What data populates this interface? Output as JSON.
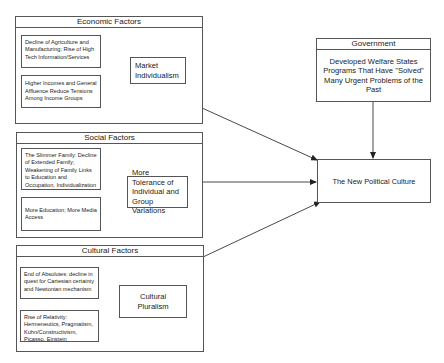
{
  "economic": {
    "title": "Economic Factors",
    "inputs": [
      "Decline of Agriculture and Manufacturing; Rise of High Tech Information/Services",
      "Higher Incomes and General Affluence Reduce Tensions Among Income Groups"
    ],
    "result": "Market Individualism"
  },
  "social": {
    "title": "Social Factors",
    "inputs": [
      "The Slimmer Family: Decline of Extended Family; Weakening of Family Links to Education and Occupation, Individualization",
      "More Education; More Media Access"
    ],
    "result": "More Tolerance of Individual and Group Variations"
  },
  "cultural": {
    "title": "Cultural Factors",
    "inputs": [
      "End of Absolutes: decline in quest for Cartesian certainty and Newtonian mechanism",
      "Rise of Relativity: Hermeneutics, Pragmatism, Kuhn/Constructivism, Picasso, Einstein"
    ],
    "result": "Cultural Pluralism"
  },
  "government": {
    "title": "Government",
    "body": "Developed Welfare States Programs That Have \"Solved\" Many Urgent Problems of the Past"
  },
  "outcome": {
    "label": "The New Political Culture"
  }
}
